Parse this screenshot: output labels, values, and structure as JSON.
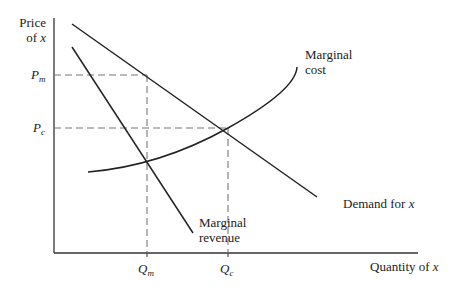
{
  "diagram": {
    "y_axis_label_line1": "Price",
    "y_axis_label_line2_prefix": "of ",
    "y_axis_label_var": "x",
    "x_axis_label_prefix": "Quantity of ",
    "x_axis_label_var": "x",
    "price_labels": [
      {
        "main": "P",
        "sub": "m"
      },
      {
        "main": "P",
        "sub": "c"
      }
    ],
    "quantity_labels": [
      {
        "main": "Q",
        "sub": "m"
      },
      {
        "main": "Q",
        "sub": "c"
      }
    ],
    "curves": {
      "marginal_cost": {
        "line1": "Marginal",
        "line2": "cost"
      },
      "marginal_revenue": {
        "line1": "Marginal",
        "line2": "revenue"
      },
      "demand": {
        "prefix": "Demand for ",
        "var": "x"
      }
    },
    "colors": {
      "line": "#222222",
      "dashed": "#666666",
      "background": "#ffffff"
    }
  }
}
